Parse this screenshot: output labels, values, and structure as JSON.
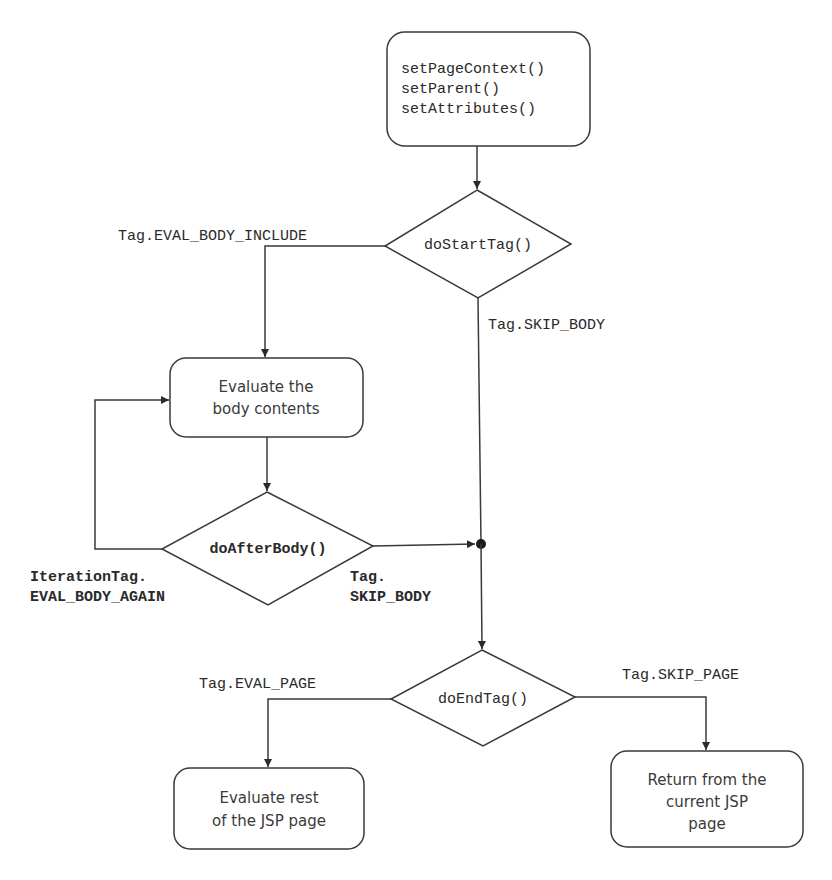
{
  "diagram": {
    "type": "flowchart",
    "nodes": {
      "init": {
        "lines": [
          "setPageContext()",
          "setParent()",
          "setAttributes()"
        ]
      },
      "doStartTag": {
        "label": "doStartTag()"
      },
      "evalBody": {
        "lines": [
          "Evaluate the",
          "body contents"
        ]
      },
      "doAfterBody": {
        "label": "doAfterBody()"
      },
      "doEndTag": {
        "label": "doEndTag()"
      },
      "evalRest": {
        "lines": [
          "Evaluate rest",
          "of the JSP page"
        ]
      },
      "returnPage": {
        "lines": [
          "Return from the",
          "current JSP",
          "page"
        ]
      }
    },
    "edges": {
      "evalBodyInclude": "Tag.EVAL_BODY_INCLUDE",
      "skipBody": "Tag.SKIP_BODY",
      "evalBodyAgain": [
        "IterationTag.",
        "EVAL_BODY_AGAIN"
      ],
      "afterSkipBody": [
        "Tag.",
        "SKIP_BODY"
      ],
      "evalPage": "Tag.EVAL_PAGE",
      "skipPage": "Tag.SKIP_PAGE"
    },
    "colors": {
      "line": "#3a3a3a",
      "background": "#ffffff"
    }
  }
}
